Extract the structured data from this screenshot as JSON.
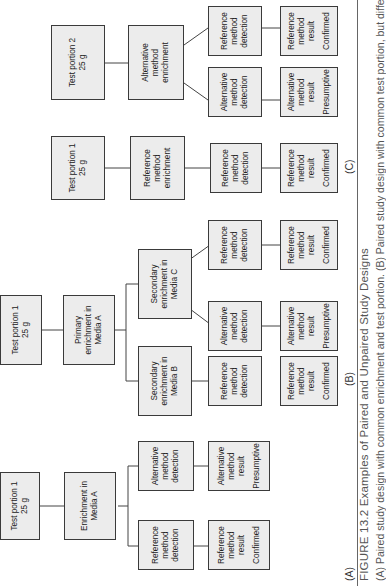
{
  "figure": {
    "number": "FIGURE 13.2",
    "title": "Examples of Paired and Unpaired Study Designs",
    "caption_body": "(A) Paired study design with common enrichment and test portion. (B) Paired study design with common test portion, but different"
  },
  "panels": {
    "A": {
      "label": "(A)",
      "test_portion": [
        "Test portion 1",
        "25 g"
      ],
      "enrichment": [
        "Enrichment in",
        "Media A"
      ],
      "detections": [
        [
          "Reference",
          "method",
          "detection"
        ],
        [
          "Alternative",
          "method",
          "detection"
        ]
      ],
      "results": [
        {
          "lines": [
            "Reference",
            "method",
            "result"
          ],
          "status": "Confirmed"
        },
        {
          "lines": [
            "Alternative",
            "method",
            "result"
          ],
          "status": "Presumptive"
        }
      ]
    },
    "B": {
      "label": "(B)",
      "test_portion": [
        "Test portion 1",
        "25 g"
      ],
      "primary": [
        "Primary",
        "enrichment in",
        "Media A"
      ],
      "secondary": [
        [
          "Secondary",
          "enrichment in",
          "Media B"
        ],
        [
          "Secondary",
          "enrichment in",
          "Media C"
        ]
      ],
      "detections": [
        [
          "Reference",
          "method",
          "detection"
        ],
        [
          "Alternative",
          "method",
          "detection"
        ],
        [
          "Reference",
          "method",
          "detection"
        ]
      ],
      "results": [
        {
          "lines": [
            "Reference",
            "method",
            "result"
          ],
          "status": "Confirmed"
        },
        {
          "lines": [
            "Alternative",
            "method",
            "result"
          ],
          "status": "Presumptive"
        },
        {
          "lines": [
            "Reference",
            "method",
            "result"
          ],
          "status": "Confirmed"
        }
      ]
    },
    "C": {
      "label": "(C)",
      "portion1": [
        "Test portion 1",
        "25 g"
      ],
      "portion2": [
        "Test portion 2",
        "25 g"
      ],
      "ref_enrichment": [
        "Reference",
        "method",
        "enrichment"
      ],
      "alt_enrichment": [
        "Alternative",
        "method",
        "enrichment"
      ],
      "detections": [
        [
          "Reference",
          "method",
          "detection"
        ],
        [
          "Alternative",
          "method",
          "detection"
        ],
        [
          "Reference",
          "method",
          "detection"
        ]
      ],
      "results": [
        {
          "lines": [
            "Reference",
            "method",
            "result"
          ],
          "status": "Confirmed"
        },
        {
          "lines": [
            "Alternative",
            "method",
            "result"
          ],
          "status": "Presumptive"
        },
        {
          "lines": [
            "Reference",
            "method",
            "result"
          ],
          "status": "Confirmed"
        }
      ]
    }
  }
}
